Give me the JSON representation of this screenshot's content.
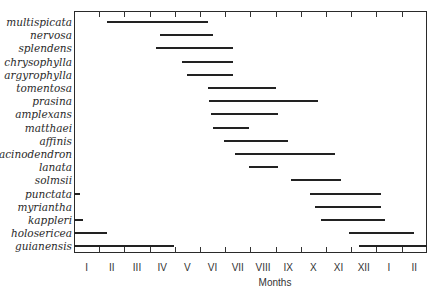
{
  "chart_data": {
    "type": "range-bar",
    "title": "",
    "xlabel": "Months",
    "ylabel": "",
    "x_ticks": [
      "I",
      "II",
      "III",
      "IV",
      "V",
      "VI",
      "VII",
      "VIII",
      "IX",
      "X",
      "XI",
      "XII",
      "I",
      "II"
    ],
    "x_range_months": [
      0,
      14
    ],
    "grid": false,
    "legend": null,
    "series": [
      {
        "name": "multispicata",
        "segments": [
          [
            1.3,
            5.3
          ]
        ]
      },
      {
        "name": "nervosa",
        "segments": [
          [
            3.4,
            5.5
          ]
        ]
      },
      {
        "name": "splendens",
        "segments": [
          [
            3.25,
            6.3
          ]
        ]
      },
      {
        "name": "chrysophylla",
        "segments": [
          [
            4.3,
            6.3
          ]
        ]
      },
      {
        "name": "argyrophylla",
        "segments": [
          [
            4.5,
            6.3
          ]
        ]
      },
      {
        "name": "tomentosa",
        "segments": [
          [
            5.3,
            8.0
          ]
        ]
      },
      {
        "name": "prasina",
        "segments": [
          [
            5.35,
            9.7
          ]
        ]
      },
      {
        "name": "amplexans",
        "segments": [
          [
            5.45,
            8.1
          ]
        ]
      },
      {
        "name": "matthaei",
        "segments": [
          [
            5.5,
            6.95
          ]
        ]
      },
      {
        "name": "affinis",
        "segments": [
          [
            5.95,
            8.5
          ]
        ]
      },
      {
        "name": "acinodendron",
        "segments": [
          [
            6.4,
            10.35
          ]
        ]
      },
      {
        "name": "lanata",
        "segments": [
          [
            6.95,
            8.1
          ]
        ]
      },
      {
        "name": "solmsii",
        "segments": [
          [
            8.6,
            10.6
          ]
        ]
      },
      {
        "name": "punctata",
        "segments": [
          [
            0.0,
            0.25
          ],
          [
            9.35,
            12.2
          ]
        ]
      },
      {
        "name": "myriantha",
        "segments": [
          [
            9.55,
            12.2
          ]
        ]
      },
      {
        "name": "kappleri",
        "segments": [
          [
            0.0,
            0.35
          ],
          [
            9.8,
            12.35
          ]
        ]
      },
      {
        "name": "holosericea",
        "segments": [
          [
            0.0,
            1.3
          ],
          [
            10.9,
            13.5
          ]
        ]
      },
      {
        "name": "guianensis",
        "segments": [
          [
            0.0,
            3.95
          ],
          [
            11.3,
            14.0
          ]
        ]
      }
    ]
  },
  "layout": {
    "plot_left": 74,
    "plot_right": 427,
    "plot_top": 11,
    "plot_bottom": 253,
    "row_top": 22,
    "row_step": 13.2,
    "month_px": 25.2
  }
}
